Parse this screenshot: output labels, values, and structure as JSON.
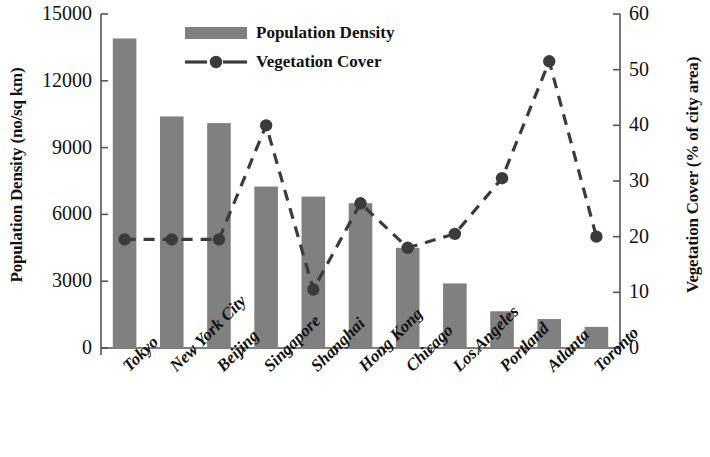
{
  "chart_data": {
    "type": "bar",
    "title": "",
    "categories": [
      "Tokyo",
      "New York City",
      "Beijing",
      "Singapore",
      "Shanghai",
      "Hong Kong",
      "Chicago",
      "Los Angeles",
      "Portland",
      "Atlanta",
      "Toronto"
    ],
    "series": [
      {
        "name": "Population Density",
        "type": "bar",
        "axis": "left",
        "unit": "no/sq km",
        "values": [
          13900,
          10400,
          10100,
          7250,
          6800,
          6500,
          4500,
          2900,
          1650,
          1300,
          950
        ]
      },
      {
        "name": "Vegetation Cover",
        "type": "line",
        "axis": "right",
        "unit": "% of city area",
        "values": [
          19.5,
          19.5,
          19.5,
          40,
          10.5,
          26,
          18,
          20.5,
          30.5,
          51.5,
          20
        ]
      }
    ],
    "xlabel": "",
    "ylabel": "Population Density (no/sq km)",
    "y2label": "Vegetation Cover (% of city area)",
    "ylim": [
      0,
      15000
    ],
    "y2lim": [
      0,
      60
    ],
    "yticks": [
      "0",
      "3000",
      "6000",
      "9000",
      "12000",
      "15000"
    ],
    "y2ticks": [
      "0",
      "10",
      "20",
      "30",
      "40",
      "50",
      "60"
    ],
    "grid": false,
    "legend_position": "top-center",
    "colors": {
      "bar": "#808080",
      "line": "#3b3b3b",
      "marker": "#3b3b3b",
      "axis": "#555555",
      "text": "#111111",
      "background": "#ffffff"
    }
  },
  "legend": {
    "items": [
      {
        "label": "Population Density",
        "marker": "filled-rect-swatch"
      },
      {
        "label": "Vegetation Cover",
        "marker": "dashed-line-circle"
      }
    ]
  }
}
